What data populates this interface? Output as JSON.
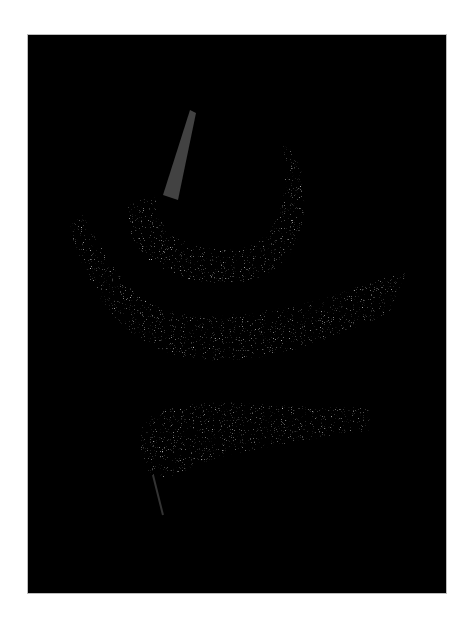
{
  "image": {
    "description": "Dark photograph of three dried chili peppers on a black background, framed by a white margin",
    "background_color": "#000000",
    "border_color": "#ffffff",
    "subjects": [
      {
        "name": "top-pepper",
        "shape": "curved U with stem pointing up"
      },
      {
        "name": "middle-pepper",
        "shape": "long wrinkled pepper curving across"
      },
      {
        "name": "bottom-pepper",
        "shape": "wide wrinkled pepper with tail at left"
      }
    ]
  }
}
